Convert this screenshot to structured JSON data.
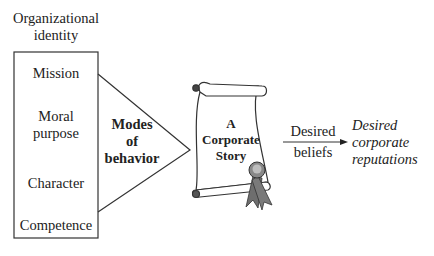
{
  "org_identity": {
    "title_line1": "Organizational",
    "title_line2": "identity",
    "items": [
      "Mission",
      "Moral",
      "purpose",
      "Character",
      "Competence"
    ]
  },
  "modes": {
    "line1": "Modes",
    "line2": "of",
    "line3": "behavior"
  },
  "story": {
    "line1": "A",
    "line2": "Corporate",
    "line3": "Story"
  },
  "arrow_label": {
    "line1": "Desired",
    "line2": "beliefs"
  },
  "outcome": {
    "line1": "Desired",
    "line2": "corporate",
    "line3": "reputations"
  },
  "colors": {
    "ribbon": "#6e6e6e",
    "seal": "#9a9a9a",
    "line": "#333333"
  }
}
